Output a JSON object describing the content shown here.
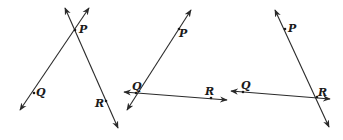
{
  "figures": [
    {
      "id": "figure-1",
      "description": "Two lines intersecting at P; Q on one line, R on the other",
      "lines": [
        {
          "from": [
            20,
            110
          ],
          "to": [
            89,
            8
          ]
        },
        {
          "from": [
            65,
            8
          ],
          "to": [
            118,
            128
          ]
        }
      ],
      "points": [
        {
          "label": "P",
          "x": 75,
          "y": 30,
          "lx": 79,
          "ly": 33
        },
        {
          "label": "Q",
          "x": 34,
          "y": 93,
          "lx": 36,
          "ly": 96
        },
        {
          "label": "R",
          "x": 106,
          "y": 101,
          "lx": 95,
          "ly": 107
        }
      ]
    },
    {
      "id": "figure-2",
      "description": "Two lines intersecting at Q; P on one line, R on the other",
      "lines": [
        {
          "from": [
            127,
            110
          ],
          "to": [
            191,
            10
          ]
        },
        {
          "from": [
            124,
            92
          ],
          "to": [
            227,
            100
          ]
        }
      ],
      "points": [
        {
          "label": "P",
          "x": 179,
          "y": 29,
          "lx": 179,
          "ly": 37
        },
        {
          "label": "Q",
          "x": 136,
          "y": 93,
          "lx": 132,
          "ly": 90
        },
        {
          "label": "R",
          "x": 211,
          "y": 98,
          "lx": 205,
          "ly": 95
        }
      ]
    },
    {
      "id": "figure-3",
      "description": "Two lines intersecting at R; P on one line, Q on the other",
      "lines": [
        {
          "from": [
            275,
            10
          ],
          "to": [
            329,
            127
          ]
        },
        {
          "from": [
            231,
            91
          ],
          "to": [
            330,
            99
          ]
        }
      ],
      "points": [
        {
          "label": "P",
          "x": 285,
          "y": 29,
          "lx": 288,
          "ly": 32
        },
        {
          "label": "Q",
          "x": 243,
          "y": 92,
          "lx": 241,
          "ly": 89
        },
        {
          "label": "R",
          "x": 317,
          "y": 97,
          "lx": 318,
          "ly": 96
        }
      ]
    }
  ]
}
